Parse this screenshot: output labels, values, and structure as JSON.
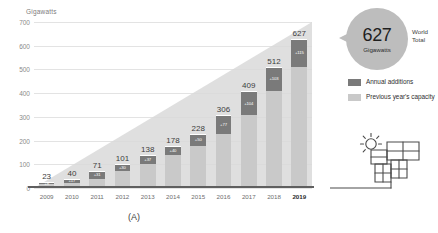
{
  "chart_data": {
    "type": "bar",
    "title": "",
    "subtitle": "",
    "xlabel": "",
    "ylabel": "Gigawatts",
    "ylim": [
      0,
      700
    ],
    "yticks": [
      0,
      100,
      200,
      300,
      400,
      500,
      600,
      700
    ],
    "grid": true,
    "legend_position": "right",
    "categories": [
      "2009",
      "2010",
      "2011",
      "2012",
      "2013",
      "2014",
      "2015",
      "2016",
      "2017",
      "2018",
      "2019"
    ],
    "values": [
      23,
      40,
      71,
      101,
      138,
      178,
      228,
      306,
      409,
      512,
      627
    ],
    "data_labels": [
      "23",
      "40",
      "71",
      "101",
      "138",
      "178",
      "228",
      "306",
      "409",
      "512",
      "627"
    ],
    "series": [
      {
        "name": "Previous year's capacity",
        "color": "#c9c9c9",
        "values": [
          15,
          23,
          40,
          71,
          101,
          138,
          178,
          228,
          306,
          409,
          512
        ]
      },
      {
        "name": "Annual additions",
        "color": "#7a7a7a",
        "values": [
          8,
          17,
          31,
          30,
          37,
          40,
          50,
          78,
          103,
          103,
          115
        ],
        "labels": [
          "+8",
          "+17",
          "+31",
          "+30",
          "+37",
          "+40",
          "+50",
          "+77",
          "+104",
          "+103",
          "+115"
        ]
      }
    ],
    "highlight_category": "2019",
    "annotations": {
      "callout_value": "627",
      "callout_unit": "Gigawatts",
      "callout_caption_line1": "World",
      "callout_caption_line2": "Total"
    }
  },
  "axis": {
    "y_title": "Gigawatts",
    "y_ticks": [
      "700",
      "600",
      "500",
      "400",
      "300",
      "200",
      "100",
      "0"
    ],
    "x_ticks": [
      "2009",
      "2010",
      "2011",
      "2012",
      "2013",
      "2014",
      "2015",
      "2016",
      "2017",
      "2018",
      "2019"
    ]
  },
  "bars": [
    {
      "year": "2009",
      "total": "23",
      "addition": "+8"
    },
    {
      "year": "2010",
      "total": "40",
      "addition": "+17"
    },
    {
      "year": "2011",
      "total": "71",
      "addition": "+31"
    },
    {
      "year": "2012",
      "total": "101",
      "addition": "+30"
    },
    {
      "year": "2013",
      "total": "138",
      "addition": "+37"
    },
    {
      "year": "2014",
      "total": "178",
      "addition": "+40"
    },
    {
      "year": "2015",
      "total": "228",
      "addition": "+50"
    },
    {
      "year": "2016",
      "total": "306",
      "addition": "+77"
    },
    {
      "year": "2017",
      "total": "409",
      "addition": "+104"
    },
    {
      "year": "2018",
      "total": "512",
      "addition": "+103"
    },
    {
      "year": "2019",
      "total": "627",
      "addition": "+115"
    }
  ],
  "callout": {
    "value": "627",
    "unit": "Gigawatts",
    "label_line1": "World",
    "label_line2": "Total"
  },
  "legend": {
    "items": [
      {
        "label": "Annual additions",
        "color": "#7a7a7a",
        "icon": "legend-swatch-dark"
      },
      {
        "label": "Previous year's capacity",
        "color": "#c9c9c9",
        "icon": "legend-swatch-light"
      }
    ]
  },
  "caption": {
    "text": "(A)"
  },
  "icons": {
    "solar_panel": "solar-panel-sun-icon"
  },
  "colors": {
    "annual_additions": "#7a7a7a",
    "previous_capacity": "#c9c9c9",
    "callout_bubble": "#bdbdbd",
    "gridline": "#e3e3e3",
    "baseline": "#5f5f5f",
    "backdrop": "#d6d6d6"
  }
}
